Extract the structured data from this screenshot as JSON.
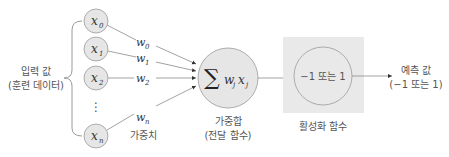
{
  "diagram": {
    "input_label": {
      "line1": "입력 값",
      "line2": "(훈련 데이터)"
    },
    "inputs": [
      {
        "var": "x",
        "sub": "0"
      },
      {
        "var": "x",
        "sub": "1"
      },
      {
        "var": "x",
        "sub": "2"
      },
      {
        "var": "x",
        "sub": "n"
      }
    ],
    "ellipsis": "⋮",
    "weights": [
      {
        "var": "w",
        "sub": "0"
      },
      {
        "var": "w",
        "sub": "1"
      },
      {
        "var": "w",
        "sub": "2"
      },
      {
        "var": "w",
        "sub": "n"
      }
    ],
    "weights_label": "가중치",
    "sum_node": {
      "sigma": "∑",
      "w": "w",
      "wsub": "j",
      "x": "x",
      "xsub": "j"
    },
    "sum_label": {
      "line1": "가중합",
      "line2": "(전달 함수)"
    },
    "activation_node": {
      "text": "−1 또는 1"
    },
    "activation_label": "활성화 함수",
    "output_label": {
      "line1": "예측 값",
      "line2": "(−1 또는 1)"
    },
    "colors": {
      "node_fill": "#e6e6e6",
      "node_stroke": "#9a9a9a",
      "box_fill": "#e9e9e9",
      "line": "#8a8a8a",
      "text": "#555555"
    }
  }
}
